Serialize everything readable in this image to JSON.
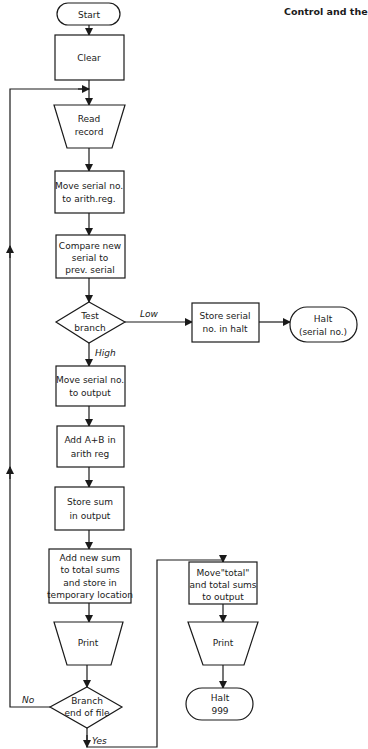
{
  "header": {
    "running_title": "Control and the"
  },
  "flowchart": {
    "nodes": {
      "start": {
        "type": "terminator",
        "lines": [
          "Start"
        ]
      },
      "clear": {
        "type": "process",
        "lines": [
          "Clear"
        ]
      },
      "read_record": {
        "type": "input",
        "lines": [
          "Read",
          "record"
        ]
      },
      "move_serial_arith": {
        "type": "process",
        "lines": [
          "Move serial no.",
          "to arith.reg."
        ]
      },
      "compare": {
        "type": "process",
        "lines": [
          "Compare new",
          "serial to",
          "prev. serial"
        ]
      },
      "test_branch": {
        "type": "decision",
        "lines": [
          "Test",
          "branch"
        ]
      },
      "store_serial_halt": {
        "type": "process",
        "lines": [
          "Store serial",
          "no. in halt"
        ]
      },
      "halt_serial": {
        "type": "terminator",
        "lines": [
          "Halt",
          "(serial no.)"
        ]
      },
      "move_serial_output": {
        "type": "process",
        "lines": [
          "Move serial no.",
          "to output"
        ]
      },
      "add_ab": {
        "type": "process",
        "lines": [
          "Add A+B in",
          "arith reg"
        ]
      },
      "store_sum": {
        "type": "process",
        "lines": [
          "Store sum",
          "in output"
        ]
      },
      "add_new_sum": {
        "type": "process",
        "lines": [
          "Add new sum",
          "to total sums",
          "and store in",
          "temporary location"
        ]
      },
      "print_1": {
        "type": "output",
        "lines": [
          "Print"
        ]
      },
      "branch_eof": {
        "type": "decision",
        "lines": [
          "Branch",
          "end of file"
        ]
      },
      "move_total": {
        "type": "process",
        "lines": [
          "Move\"total\"",
          "and total sums",
          "to output"
        ]
      },
      "print_2": {
        "type": "output",
        "lines": [
          "Print"
        ]
      },
      "halt_999": {
        "type": "terminator",
        "lines": [
          "Halt",
          "999"
        ]
      }
    },
    "edge_labels": {
      "low": "Low",
      "high": "High",
      "no": "No",
      "yes": "Yes"
    }
  }
}
